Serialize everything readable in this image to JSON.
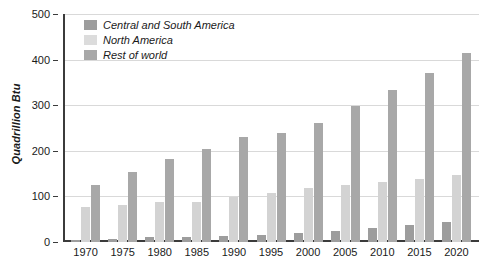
{
  "chart_data": {
    "type": "bar",
    "title": "",
    "subtitle": "",
    "xlabel": "",
    "ylabel": "Quadrillion Btu",
    "ylim": [
      0,
      500
    ],
    "yticks": [
      0,
      100,
      200,
      300,
      400,
      500
    ],
    "grid": true,
    "legend_position": "top-left",
    "categories": [
      "1970",
      "1975",
      "1980",
      "1985",
      "1990",
      "1995",
      "2000",
      "2005",
      "2010",
      "2015",
      "2020"
    ],
    "series": [
      {
        "name": "Central and South America",
        "color": "#9d9d9d",
        "values": [
          4,
          6,
          10,
          11,
          13,
          16,
          20,
          25,
          30,
          37,
          43
        ]
      },
      {
        "name": "North America",
        "color": "#d3d3d3",
        "values": [
          76,
          81,
          88,
          87,
          98,
          107,
          118,
          125,
          132,
          139,
          146
        ]
      },
      {
        "name": "Rest of world",
        "color": "#a8a8a8",
        "values": [
          124,
          153,
          181,
          205,
          231,
          240,
          260,
          298,
          334,
          370,
          414
        ]
      }
    ]
  }
}
